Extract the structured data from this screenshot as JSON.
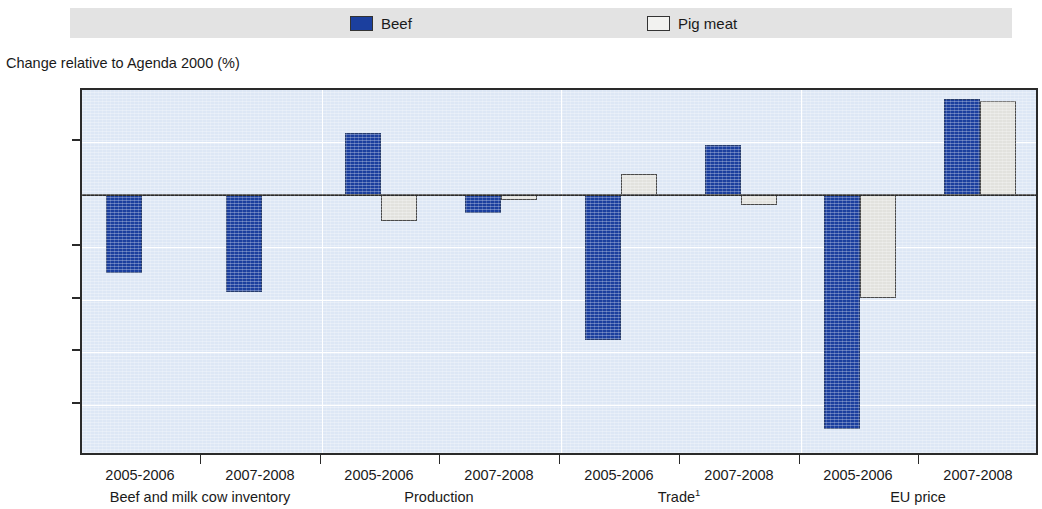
{
  "legend": {
    "items": [
      {
        "label": "Beef",
        "color": "#1b3f9e",
        "icon": "legend-swatch-filled"
      },
      {
        "label": "Pig meat",
        "color": "#f2f2f0",
        "icon": "legend-swatch-outline"
      }
    ]
  },
  "axis_caption": "Change relative to Agenda 2000 (%)",
  "footnote_marker": "1",
  "chart_data": {
    "type": "bar",
    "title": "",
    "subtitle": "",
    "xlabel": "",
    "ylabel": "Change relative to Agenda 2000 (%)",
    "ylim": [
      -5,
      2
    ],
    "yticks": [
      2,
      1,
      0,
      -1,
      -2,
      -3,
      -4,
      -5
    ],
    "ytick_labels": [
      "2",
      "1",
      "0",
      "-1",
      "-2",
      "-3",
      "-4",
      "-5"
    ],
    "grid": true,
    "grid_color": "#ffffff",
    "plot_background": "#dde7f5",
    "legend_position": "top",
    "categories": [
      "2005-2006",
      "2007-2008",
      "2005-2006",
      "2007-2008",
      "2005-2006",
      "2007-2008",
      "2005-2006",
      "2007-2008"
    ],
    "groups": [
      {
        "label": "Beef and milk cow inventory",
        "categories": [
          "2005-2006",
          "2007-2008"
        ]
      },
      {
        "label": "Production",
        "categories": [
          "2005-2006",
          "2007-2008"
        ]
      },
      {
        "label": "Trade",
        "label_superscript": "1",
        "categories": [
          "2005-2006",
          "2007-2008"
        ]
      },
      {
        "label": "EU price",
        "categories": [
          "2005-2006",
          "2007-2008"
        ]
      }
    ],
    "series": [
      {
        "name": "Beef",
        "color": "#1b3f9e",
        "values": [
          -1.48,
          -1.85,
          1.18,
          -0.34,
          -2.77,
          0.95,
          -4.47,
          1.83
        ]
      },
      {
        "name": "Pig meat",
        "color": "#e2e2de",
        "values": [
          0,
          0,
          -0.5,
          -0.1,
          0.4,
          -0.2,
          -1.96,
          1.79
        ]
      }
    ]
  }
}
